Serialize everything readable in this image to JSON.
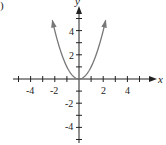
{
  "part_label": ")",
  "chart_data": {
    "type": "line",
    "title": "",
    "function": "y = x^2",
    "xlabel": "x",
    "ylabel": "y",
    "xlim": [
      -5,
      5
    ],
    "ylim": [
      -5,
      5
    ],
    "grid": false,
    "legend": null,
    "x_tick_labels": [
      "-4",
      "-2",
      "2",
      "4"
    ],
    "y_tick_labels": [
      "4",
      "2",
      "-2",
      "-4"
    ],
    "x": [
      -2.3,
      -2,
      -1.5,
      -1,
      -0.5,
      0,
      0.5,
      1,
      1.5,
      2,
      2.3
    ],
    "series": [
      {
        "name": "y = x^2",
        "values": [
          5.29,
          4,
          2.25,
          1,
          0.25,
          0,
          0.25,
          1,
          2.25,
          4,
          5.29
        ],
        "color": "#777777"
      }
    ],
    "axis_color": "#222222"
  }
}
